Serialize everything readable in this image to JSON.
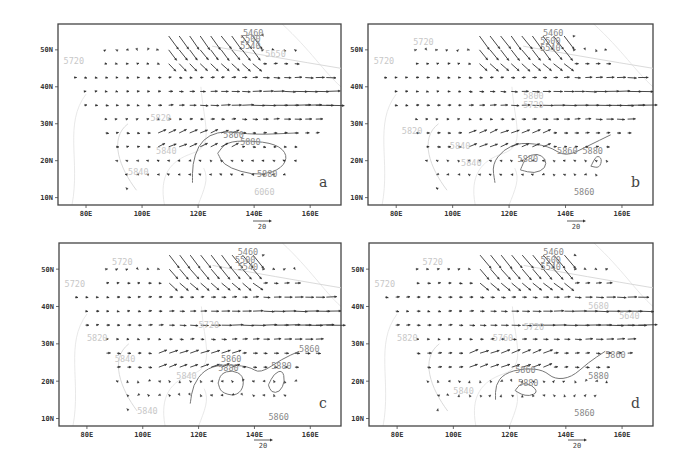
{
  "figure": {
    "background": "#ffffff",
    "vector_color": "#333333",
    "contour_color_dark": "#888888",
    "contour_color_light": "#cccccc"
  },
  "chart_data": [
    {
      "type": "vector-contour-map",
      "panel": "a",
      "xlabel": "",
      "ylabel": "",
      "xticks": [
        "80E",
        "100E",
        "120E",
        "140E",
        "160E"
      ],
      "yticks": [
        "10N",
        "20N",
        "30N",
        "40N",
        "50N"
      ],
      "xlim": [
        70,
        171
      ],
      "ylim": [
        8,
        57
      ],
      "reference_vector": {
        "label": "20",
        "units": "m/s"
      },
      "contour_labels": [
        {
          "text": "5460",
          "lon": 136,
          "lat": 54.5,
          "style": "dark"
        },
        {
          "text": "5500",
          "lon": 135,
          "lat": 53,
          "style": "dark"
        },
        {
          "text": "5540",
          "lon": 135,
          "lat": 51,
          "style": "dark"
        },
        {
          "text": "5650",
          "lon": 144,
          "lat": 49,
          "style": "light"
        },
        {
          "text": "5720",
          "lon": 72,
          "lat": 47,
          "style": "light"
        },
        {
          "text": "5820",
          "lon": 103,
          "lat": 31.5,
          "style": "light"
        },
        {
          "text": "5840",
          "lon": 105,
          "lat": 22.5,
          "style": "light"
        },
        {
          "text": "5840",
          "lon": 95,
          "lat": 17,
          "style": "light"
        },
        {
          "text": "5860",
          "lon": 129,
          "lat": 27,
          "style": "dark"
        },
        {
          "text": "5880",
          "lon": 135,
          "lat": 25,
          "style": "dark"
        },
        {
          "text": "5880",
          "lon": 141,
          "lat": 16.5,
          "style": "dark"
        },
        {
          "text": "6060",
          "lon": 140,
          "lat": 11.5,
          "style": "light"
        }
      ],
      "contours": [
        {
          "value": 5880,
          "closed": true,
          "points": [
            [
              127,
              22
            ],
            [
              130,
              25
            ],
            [
              138,
              25.5
            ],
            [
              148,
              24.5
            ],
            [
              152,
              21.5
            ],
            [
              150,
              18
            ],
            [
              143,
              16
            ],
            [
              135,
              17
            ],
            [
              129,
              19
            ]
          ]
        },
        {
          "value": 5860,
          "closed": false,
          "points": [
            [
              118,
              14
            ],
            [
              118,
              19
            ],
            [
              120,
              24
            ],
            [
              124,
              27
            ],
            [
              130,
              28
            ],
            [
              140,
              27
            ],
            [
              155,
              27.5
            ]
          ]
        }
      ],
      "letter": "a"
    },
    {
      "type": "vector-contour-map",
      "panel": "b",
      "xticks": [
        "80E",
        "100E",
        "120E",
        "140E",
        "160E"
      ],
      "yticks": [
        "10N",
        "20N",
        "30N",
        "40N",
        "50N"
      ],
      "xlim": [
        70,
        171
      ],
      "ylim": [
        8,
        57
      ],
      "reference_vector": {
        "label": "20",
        "units": "m/s"
      },
      "contour_labels": [
        {
          "text": "5460",
          "lon": 132,
          "lat": 54.5,
          "style": "dark"
        },
        {
          "text": "5500",
          "lon": 131,
          "lat": 52.5,
          "style": "dark"
        },
        {
          "text": "5540",
          "lon": 131,
          "lat": 50.5,
          "style": "dark"
        },
        {
          "text": "5720",
          "lon": 86,
          "lat": 52,
          "style": "light"
        },
        {
          "text": "5720",
          "lon": 72,
          "lat": 47,
          "style": "light"
        },
        {
          "text": "5800",
          "lon": 125,
          "lat": 37.5,
          "style": "light"
        },
        {
          "text": "5720",
          "lon": 125,
          "lat": 35,
          "style": "light"
        },
        {
          "text": "5820",
          "lon": 82,
          "lat": 28,
          "style": "light"
        },
        {
          "text": "5840",
          "lon": 99,
          "lat": 24,
          "style": "light"
        },
        {
          "text": "5840",
          "lon": 103,
          "lat": 19.5,
          "style": "light"
        },
        {
          "text": "5880",
          "lon": 123,
          "lat": 20.5,
          "style": "dark"
        },
        {
          "text": "5860",
          "lon": 137,
          "lat": 22.5,
          "style": "dark"
        },
        {
          "text": "5880",
          "lon": 146,
          "lat": 22.5,
          "style": "dark"
        },
        {
          "text": "5860",
          "lon": 143,
          "lat": 11.5,
          "style": "dark"
        }
      ],
      "contours": [
        {
          "value": 5880,
          "closed": true,
          "points": [
            [
              124,
              17.5
            ],
            [
              126,
              21
            ],
            [
              130,
              22
            ],
            [
              133,
              20.5
            ],
            [
              133,
              18
            ],
            [
              129,
              16.5
            ]
          ]
        },
        {
          "value": 5880,
          "closed": true,
          "points": [
            [
              149,
              18.5
            ],
            [
              151,
              21.5
            ],
            [
              153,
              20.5
            ],
            [
              152,
              18
            ]
          ]
        },
        {
          "value": 5860,
          "closed": false,
          "points": [
            [
              115,
              14
            ],
            [
              114,
              19
            ],
            [
              118,
              23
            ],
            [
              124,
              25
            ],
            [
              134,
              24
            ],
            [
              140,
              21
            ],
            [
              148,
              24
            ],
            [
              156,
              27
            ]
          ]
        }
      ],
      "letter": "b"
    },
    {
      "type": "vector-contour-map",
      "panel": "c",
      "xticks": [
        "80E",
        "100E",
        "120E",
        "140E",
        "160E"
      ],
      "yticks": [
        "10N",
        "20N",
        "30N",
        "40N",
        "50N"
      ],
      "xlim": [
        70,
        171
      ],
      "ylim": [
        8,
        57
      ],
      "reference_vector": {
        "label": "20",
        "units": "m/s"
      },
      "contour_labels": [
        {
          "text": "5460",
          "lon": 134,
          "lat": 54.5,
          "style": "dark"
        },
        {
          "text": "5500",
          "lon": 133,
          "lat": 52.5,
          "style": "dark"
        },
        {
          "text": "5540",
          "lon": 134,
          "lat": 50.5,
          "style": "dark"
        },
        {
          "text": "5720",
          "lon": 89,
          "lat": 52,
          "style": "light"
        },
        {
          "text": "5720",
          "lon": 72,
          "lat": 46,
          "style": "light"
        },
        {
          "text": "5720",
          "lon": 120,
          "lat": 35,
          "style": "light"
        },
        {
          "text": "5820",
          "lon": 80,
          "lat": 31.5,
          "style": "light"
        },
        {
          "text": "5840",
          "lon": 90,
          "lat": 26,
          "style": "light"
        },
        {
          "text": "5840",
          "lon": 112,
          "lat": 21.5,
          "style": "light"
        },
        {
          "text": "5840",
          "lon": 98,
          "lat": 12,
          "style": "light"
        },
        {
          "text": "5860",
          "lon": 128,
          "lat": 26,
          "style": "dark"
        },
        {
          "text": "5880",
          "lon": 127,
          "lat": 23.5,
          "style": "dark"
        },
        {
          "text": "5880",
          "lon": 146,
          "lat": 24,
          "style": "dark"
        },
        {
          "text": "5860",
          "lon": 156,
          "lat": 28.5,
          "style": "dark"
        },
        {
          "text": "5860",
          "lon": 145,
          "lat": 10.5,
          "style": "dark"
        }
      ],
      "contours": [
        {
          "value": 5880,
          "closed": true,
          "points": [
            [
              127,
              19.5
            ],
            [
              128,
              22
            ],
            [
              132,
              23
            ],
            [
              136,
              21.5
            ],
            [
              136,
              18
            ],
            [
              133,
              16
            ],
            [
              128,
              17
            ]
          ]
        },
        {
          "value": 5880,
          "closed": true,
          "points": [
            [
              145,
              19
            ],
            [
              147,
              22
            ],
            [
              150,
              23
            ],
            [
              151,
              20
            ],
            [
              149,
              17
            ],
            [
              146,
              17
            ]
          ]
        },
        {
          "value": 5860,
          "closed": false,
          "points": [
            [
              117,
              14
            ],
            [
              118,
              19
            ],
            [
              122,
              23
            ],
            [
              128,
              24.5
            ],
            [
              138,
              24
            ],
            [
              142,
              22
            ],
            [
              150,
              26
            ],
            [
              156,
              28
            ]
          ]
        }
      ],
      "letter": "c"
    },
    {
      "type": "vector-contour-map",
      "panel": "d",
      "xticks": [
        "80E",
        "100E",
        "120E",
        "140E",
        "160E"
      ],
      "yticks": [
        "10N",
        "20N",
        "30N",
        "40N",
        "50N"
      ],
      "xlim": [
        70,
        171
      ],
      "ylim": [
        8,
        57
      ],
      "reference_vector": {
        "label": "20",
        "units": "m/s"
      },
      "contour_labels": [
        {
          "text": "5460",
          "lon": 132,
          "lat": 54.5,
          "style": "dark"
        },
        {
          "text": "5500",
          "lon": 131,
          "lat": 52.5,
          "style": "dark"
        },
        {
          "text": "5540",
          "lon": 131,
          "lat": 50.5,
          "style": "dark"
        },
        {
          "text": "5720",
          "lon": 89,
          "lat": 52,
          "style": "light"
        },
        {
          "text": "5720",
          "lon": 72,
          "lat": 46,
          "style": "light"
        },
        {
          "text": "5680",
          "lon": 148,
          "lat": 40,
          "style": "light"
        },
        {
          "text": "5640",
          "lon": 159,
          "lat": 37.5,
          "style": "light"
        },
        {
          "text": "5720",
          "lon": 125,
          "lat": 34.5,
          "style": "light"
        },
        {
          "text": "5760",
          "lon": 114,
          "lat": 31.5,
          "style": "light"
        },
        {
          "text": "5820",
          "lon": 80,
          "lat": 31.5,
          "style": "light"
        },
        {
          "text": "5840",
          "lon": 100,
          "lat": 17.5,
          "style": "light"
        },
        {
          "text": "5860",
          "lon": 122,
          "lat": 23,
          "style": "dark"
        },
        {
          "text": "5880",
          "lon": 123,
          "lat": 19.5,
          "style": "dark"
        },
        {
          "text": "5860",
          "lon": 154,
          "lat": 27,
          "style": "dark"
        },
        {
          "text": "5880",
          "lon": 148,
          "lat": 21.5,
          "style": "dark"
        },
        {
          "text": "5860",
          "lon": 143,
          "lat": 11.5,
          "style": "dark"
        }
      ],
      "contours": [
        {
          "value": 5880,
          "closed": true,
          "points": [
            [
              122,
              17.5
            ],
            [
              124,
              19.5
            ],
            [
              128,
              19
            ],
            [
              130,
              17
            ],
            [
              127,
              16
            ],
            [
              124,
              16.5
            ]
          ]
        },
        {
          "value": 5860,
          "closed": false,
          "points": [
            [
              115,
              15
            ],
            [
              115,
              19
            ],
            [
              118,
              22
            ],
            [
              125,
              23.5
            ],
            [
              132,
              23
            ],
            [
              136,
              20.5
            ],
            [
              142,
              21
            ],
            [
              148,
              25
            ],
            [
              154,
              28
            ]
          ]
        }
      ],
      "letter": "d"
    }
  ],
  "panels": [
    {
      "id": "a",
      "x": 58,
      "y": 24,
      "w": 283,
      "h": 181,
      "ref_x": 262,
      "ref_y": 221
    },
    {
      "id": "b",
      "x": 368,
      "y": 24,
      "w": 285,
      "h": 181,
      "ref_x": 576,
      "ref_y": 221
    },
    {
      "id": "c",
      "x": 59,
      "y": 243,
      "w": 282,
      "h": 183,
      "ref_x": 263,
      "ref_y": 440
    },
    {
      "id": "d",
      "x": 369,
      "y": 243,
      "w": 284,
      "h": 183,
      "ref_x": 577,
      "ref_y": 440
    }
  ]
}
